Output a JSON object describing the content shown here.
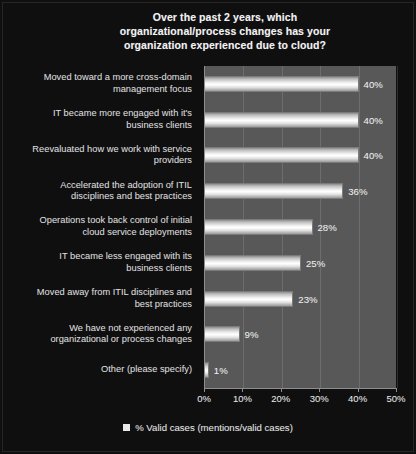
{
  "chart_data": {
    "type": "bar",
    "orientation": "horizontal",
    "title": "Over the past 2 years, which organizational/process changes has your organization experienced due to cloud?",
    "title_lines": [
      "Over the past 2 years, which",
      "organizational/process changes has your",
      "organization experienced due to cloud?"
    ],
    "categories": [
      "Moved toward a more cross-domain management focus",
      "IT became more engaged with it's business clients",
      "Reevaluated how we work with service providers",
      "Accelerated the adoption of ITIL disciplines and best practices",
      "Operations took back control of initial cloud service deployments",
      "IT became less engaged with its business clients",
      "Moved away from ITIL disciplines and best practices",
      "We have not experienced any organizational or process changes",
      "Other (please specify)"
    ],
    "category_lines": [
      [
        "Moved toward a more cross-domain",
        "management focus"
      ],
      [
        "IT became more engaged with it's",
        "business clients"
      ],
      [
        "Reevaluated how we work with service",
        "providers"
      ],
      [
        "Accelerated the adoption of ITIL",
        "disciplines and best practices"
      ],
      [
        "Operations took back control of initial",
        "cloud service deployments"
      ],
      [
        "IT became less engaged with its",
        "business clients"
      ],
      [
        "Moved away from ITIL disciplines and",
        "best practices"
      ],
      [
        "We have not experienced any",
        "organizational or process changes"
      ],
      [
        "Other (please specify)"
      ]
    ],
    "values": [
      40,
      40,
      40,
      36,
      28,
      25,
      23,
      9,
      1
    ],
    "value_labels": [
      "40%",
      "40%",
      "40%",
      "36%",
      "28%",
      "25%",
      "23%",
      "9%",
      "1%"
    ],
    "xlabel": "",
    "ylabel": "",
    "xlim": [
      0,
      50
    ],
    "xticks": [
      0,
      10,
      20,
      30,
      40,
      50
    ],
    "xtick_labels": [
      "0%",
      "10%",
      "20%",
      "30%",
      "40%",
      "50%"
    ],
    "grid": true,
    "legend": {
      "position": "bottom",
      "entries": [
        {
          "label": "% Valid cases (mentions/valid cases)",
          "marker": "square",
          "color": "#e9e9e9"
        }
      ]
    },
    "colors": {
      "figure_background": "#0f0f10",
      "plot_background": "#585858",
      "bar_fill": "#ffffff",
      "bar_edge": "#7b7b7b",
      "text": "#e6e6e6",
      "title_text": "#f2f2f2",
      "axis_line": "#8e8e8e"
    }
  }
}
